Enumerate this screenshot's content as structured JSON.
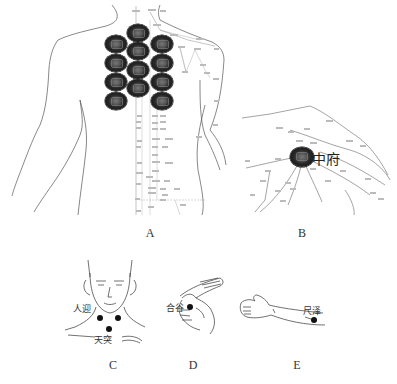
{
  "figure": {
    "panels": [
      {
        "id": "A",
        "letter": "A",
        "description": "Back view of upper body with meridian chart; 12 moxibustion discs on upper back",
        "discs": [
          {
            "x": 138,
            "y": 33
          },
          {
            "x": 138,
            "y": 51
          },
          {
            "x": 138,
            "y": 70
          },
          {
            "x": 138,
            "y": 88
          },
          {
            "x": 116,
            "y": 44
          },
          {
            "x": 116,
            "y": 63
          },
          {
            "x": 116,
            "y": 82
          },
          {
            "x": 116,
            "y": 101
          },
          {
            "x": 162,
            "y": 44
          },
          {
            "x": 162,
            "y": 63
          },
          {
            "x": 162,
            "y": 82
          },
          {
            "x": 162,
            "y": 101
          }
        ]
      },
      {
        "id": "B",
        "letter": "B",
        "point_label": "中府",
        "description": "Chest/shoulder meridian chart with disc on Zhongfu point"
      },
      {
        "id": "C",
        "letter": "C",
        "point_labels": [
          "人迎",
          "天突"
        ],
        "description": "Face and neck showing Renying and Tiantu points"
      },
      {
        "id": "D",
        "letter": "D",
        "point_label": "合谷",
        "description": "Hand showing Hegu point"
      },
      {
        "id": "E",
        "letter": "E",
        "point_label": "尺泽",
        "description": "Forearm showing Chize point"
      }
    ]
  }
}
